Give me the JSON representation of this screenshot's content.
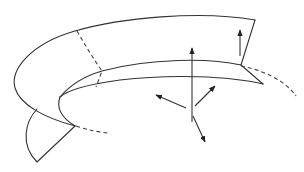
{
  "diagram": {
    "title": "",
    "colors": {
      "stroke": "#333333",
      "background": "#ffffff"
    },
    "elements": {
      "outer_edge": "outer boundary curve of the band",
      "inner_edge_upper": "upper inner edge of the band",
      "inner_edge_lower": "lower inner edge of the band",
      "right_end": "right cut end of the band",
      "left_flap": "lower left flap section",
      "hidden_edges": [
        "dashed cross-section line",
        "dashed continuation right",
        "dashed continuation bottom-left"
      ],
      "vectors": [
        "vertical normal arrow (long)",
        "vertical normal arrow (short, right)",
        "arrow upper-left",
        "arrow upper-right",
        "arrow lower-right"
      ]
    }
  }
}
